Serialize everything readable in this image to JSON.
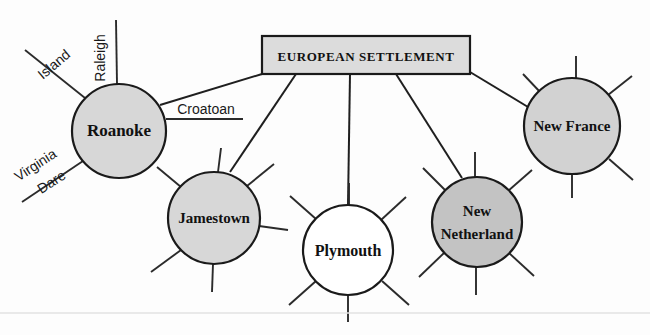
{
  "diagram": {
    "title": "EUROPEAN SETTLEMENT",
    "type": "concept-map",
    "background_color": "#fdfdfd",
    "line_color": "#1f1f1f",
    "hub": {
      "label": "EUROPEAN SETTLEMENT",
      "shape": "rectangle",
      "fill_color": "#dcdcdc",
      "x": 262,
      "y": 36,
      "width": 208,
      "height": 38
    },
    "nodes": [
      {
        "id": "roanoke",
        "label": "Roanoke",
        "label_lines": [
          "Roanoke"
        ],
        "fill_color": "#d7d7d7",
        "cx": 119,
        "cy": 131,
        "r": 47,
        "spoke_labels": [
          "Raleigh",
          "Island",
          "Virginia Dare",
          "Croatoan"
        ]
      },
      {
        "id": "jamestown",
        "label": "Jamestown",
        "label_lines": [
          "Jamestown"
        ],
        "fill_color": "#d7d7d7",
        "cx": 214,
        "cy": 218,
        "r": 46,
        "spoke_labels": []
      },
      {
        "id": "plymouth",
        "label": "Plymouth",
        "label_lines": [
          "Plymouth"
        ],
        "fill_color": "#ffffff",
        "cx": 348,
        "cy": 250,
        "r": 45,
        "spoke_labels": []
      },
      {
        "id": "new-netherland",
        "label": "New Netherland",
        "label_lines": [
          "New",
          "Netherland"
        ],
        "fill_color": "#c3c3c3",
        "cx": 477,
        "cy": 222,
        "r": 45,
        "spoke_labels": []
      },
      {
        "id": "new-france",
        "label": "New France",
        "label_lines": [
          "New France"
        ],
        "fill_color": "#d2d2d2",
        "cx": 572,
        "cy": 126,
        "r": 48,
        "spoke_labels": []
      }
    ],
    "spoke_labels": {
      "raleigh": "Raleigh",
      "island": "Island",
      "virginia": "Virginia",
      "dare": "Dare",
      "croatoan": "Croatoan"
    },
    "connections": [
      {
        "from": "hub",
        "to": "roanoke"
      },
      {
        "from": "hub",
        "to": "jamestown"
      },
      {
        "from": "hub",
        "to": "plymouth"
      },
      {
        "from": "hub",
        "to": "new-netherland"
      },
      {
        "from": "hub",
        "to": "new-france"
      }
    ]
  }
}
